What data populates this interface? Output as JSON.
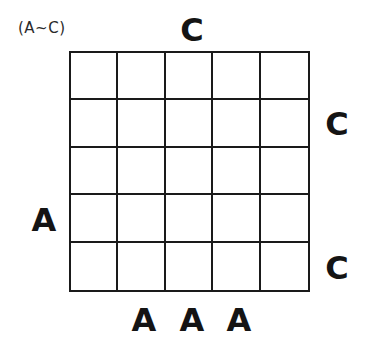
{
  "puzzle": {
    "range_label": "(A~C)",
    "grid_size": 5,
    "cells": [
      [
        "",
        "",
        "",
        "",
        ""
      ],
      [
        "",
        "",
        "",
        "",
        ""
      ],
      [
        "",
        "",
        "",
        "",
        ""
      ],
      [
        "",
        "",
        "",
        "",
        ""
      ],
      [
        "",
        "",
        "",
        "",
        ""
      ]
    ],
    "clues": {
      "top": [
        "",
        "",
        "C",
        "",
        ""
      ],
      "bottom": [
        "",
        "A",
        "A",
        "A",
        ""
      ],
      "left": [
        "",
        "",
        "",
        "A",
        ""
      ],
      "right": [
        "",
        "C",
        "",
        "",
        "C"
      ]
    },
    "colors": {
      "line": "#1a1a1a",
      "text": "#141414",
      "background": "#ffffff"
    }
  }
}
